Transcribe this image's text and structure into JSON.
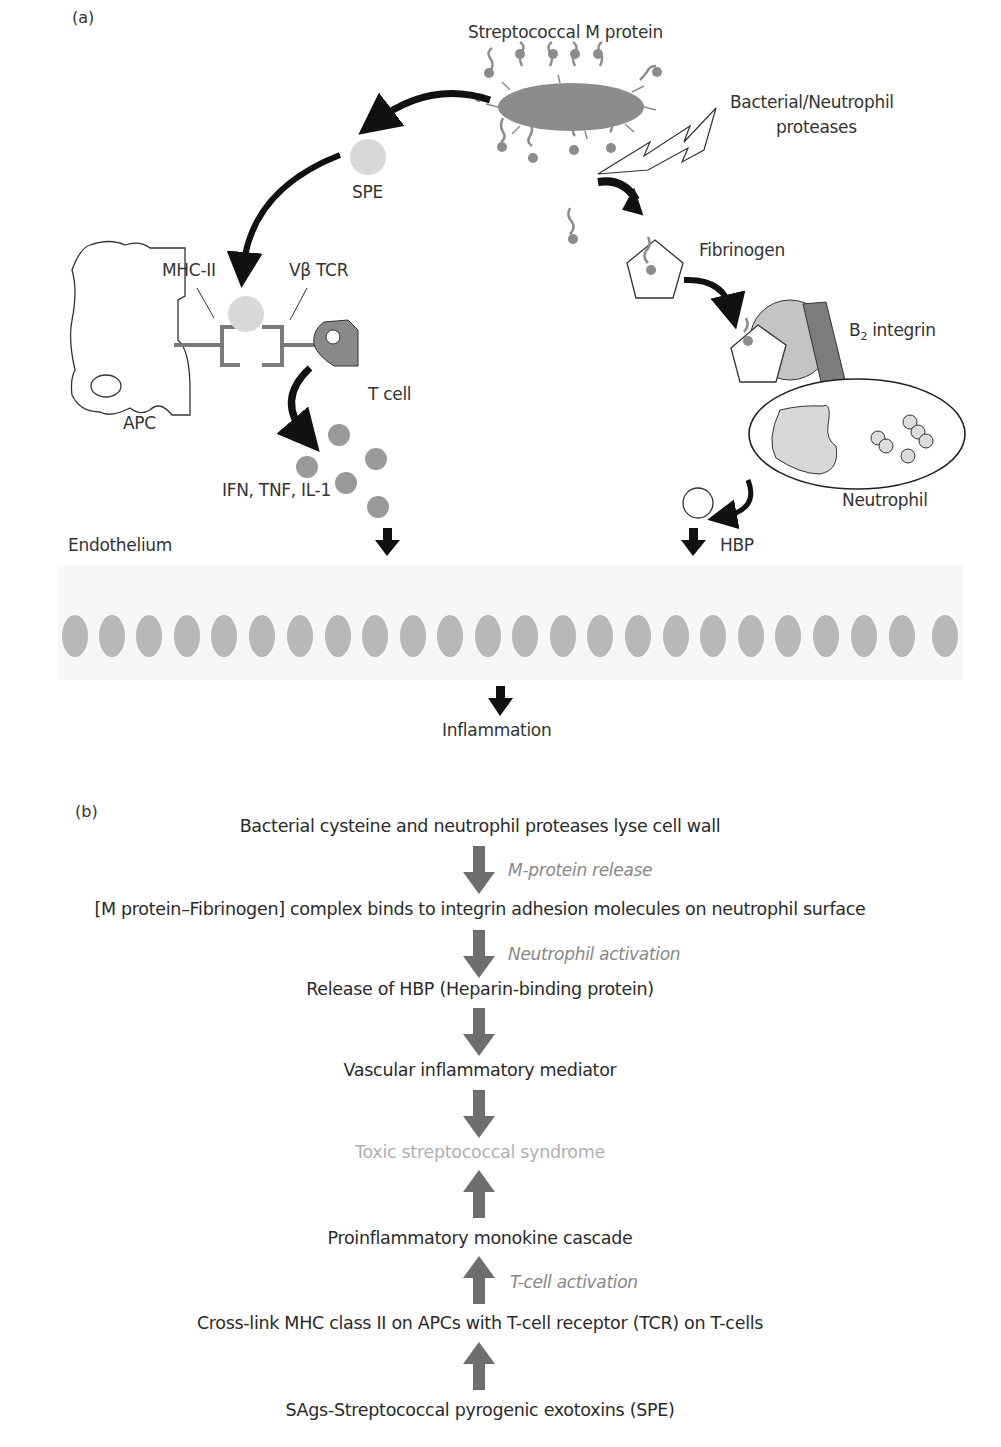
{
  "panel_a": {
    "label": "(a)",
    "labels": {
      "m_protein": "Streptococcal M protein",
      "proteases_line1": "Bacterial/Neutrophil",
      "proteases_line2": "proteases",
      "spe": "SPE",
      "mhc": "MHC-II",
      "tcr": "Vβ TCR",
      "apc": "APC",
      "tcell": "T cell",
      "cytokines": "IFN, TNF, IL-1",
      "fibrinogen": "Fibrinogen",
      "integrin": "B",
      "integrin_sub": "2",
      "integrin_suffix": " integrin",
      "neutrophil": "Neutrophil",
      "hbp": "HBP",
      "endothelium": "Endothelium",
      "inflammation": "Inflammation"
    },
    "colors": {
      "bacterium": "#8c8c8c",
      "spe": "#d8d8d8",
      "tcell": "#8a8a8a",
      "cytokine": "#9a9a9a",
      "endothelial_cell": "#b8b8b8",
      "integrin": "#7d7d7d",
      "fibrinogen_receptor": "#c4c4c4",
      "arrow": "#111111"
    },
    "endothelial_cell_count": 24
  },
  "panel_b": {
    "label": "(b)",
    "steps": [
      "Bacterial cysteine and neutrophil proteases lyse cell wall",
      "[M protein–Fibrinogen] complex binds to integrin adhesion molecules on neutrophil surface",
      "Release of HBP (Heparin-binding protein)",
      "Vascular inflammatory mediator",
      "Toxic streptococcal syndrome",
      "Proinflammatory monokine cascade",
      "Cross-link MHC class II on APCs with T-cell receptor (TCR) on T-cells",
      "SAgs-Streptococcal pyrogenic exotoxins (SPE)"
    ],
    "annotations": {
      "m_protein_release": "M-protein release",
      "neutrophil_activation": "Neutrophil activation",
      "tcell_activation": "T-cell activation"
    },
    "colors": {
      "arrow": "#6e6e6e",
      "outcome_text": "#b0b0b0",
      "annotation_text": "#888888"
    }
  }
}
